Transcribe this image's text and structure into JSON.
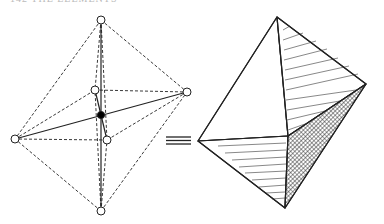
{
  "page": {
    "header_text": "142   THE ELEMENTS",
    "identity_symbol": "≡"
  },
  "figure": {
    "left_diagram": {
      "description": "octahedral coordination: ball-and-stick with dashed edges",
      "center_atom": {
        "x": 101,
        "y": 115,
        "fill": "#000000"
      },
      "vertices": [
        {
          "name": "top",
          "x": 101,
          "y": 20
        },
        {
          "name": "right",
          "x": 187,
          "y": 92
        },
        {
          "name": "left",
          "x": 15,
          "y": 139
        },
        {
          "name": "back",
          "x": 95,
          "y": 90
        },
        {
          "name": "front",
          "x": 107,
          "y": 140
        },
        {
          "name": "bottom",
          "x": 101,
          "y": 211
        }
      ]
    },
    "right_diagram": {
      "description": "solid octahedron with hatched faces",
      "vertices": {
        "top": [
          277,
          17
        ],
        "right": [
          366,
          84
        ],
        "left": [
          198,
          141
        ],
        "front": [
          288,
          136
        ],
        "bottom": [
          285,
          208
        ]
      }
    }
  }
}
